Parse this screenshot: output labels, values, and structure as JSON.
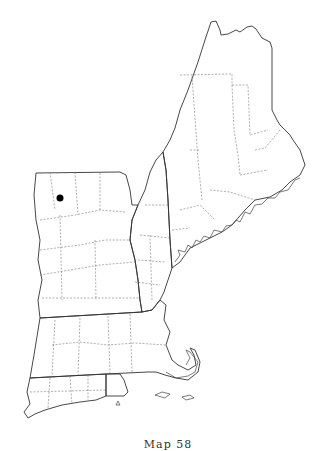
{
  "map": {
    "title": "New England county outline map",
    "caption": "Map 58",
    "marker": {
      "label": "record",
      "color": "#000000",
      "x": 60,
      "y": 198
    },
    "colors": {
      "outline": "#333333",
      "county_lines": "#777777",
      "background": "#ffffff"
    }
  }
}
